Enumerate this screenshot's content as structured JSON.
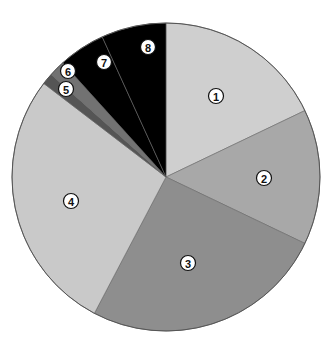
{
  "chart_data": {
    "type": "pie",
    "title": "",
    "start_angle_deg": 0,
    "direction": "clockwise",
    "center": [
      166,
      177
    ],
    "radius": 154,
    "legend": "none",
    "slices": [
      {
        "label": "1",
        "glyph": "①",
        "value": 17.9,
        "color": "#cfcfcf",
        "label_pos": [
          216,
          96
        ]
      },
      {
        "label": "2",
        "glyph": "②",
        "value": 14.2,
        "color": "#a8a8a8",
        "label_pos": [
          264,
          178
        ]
      },
      {
        "label": "3",
        "glyph": "③",
        "value": 25.6,
        "color": "#8e8e8e",
        "label_pos": [
          188,
          263
        ]
      },
      {
        "label": "4",
        "glyph": "④",
        "value": 27.7,
        "color": "#c9c9c9",
        "label_pos": [
          71,
          201
        ]
      },
      {
        "label": "5",
        "glyph": "⑤",
        "value": 1.2,
        "color": "#555555",
        "label_pos": [
          66,
          89
        ]
      },
      {
        "label": "6",
        "glyph": "⑥",
        "value": 1.7,
        "color": "#727272",
        "label_pos": [
          68,
          71
        ]
      },
      {
        "label": "7",
        "glyph": "⑦",
        "value": 4.9,
        "color": "#000000",
        "label_pos": [
          104,
          62
        ]
      },
      {
        "label": "8",
        "glyph": "⑧",
        "value": 6.8,
        "color": "#000000",
        "label_pos": [
          148,
          47
        ]
      }
    ]
  }
}
